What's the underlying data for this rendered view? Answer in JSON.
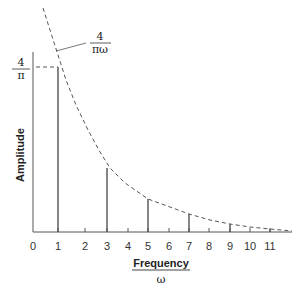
{
  "chart_data": {
    "type": "bar",
    "title": "",
    "xlabel": "Frequency / ω",
    "xlabel_numerator": "Frequency",
    "xlabel_denominator": "ω",
    "ylabel": "Amplitude",
    "x_ticks": [
      0,
      1,
      2,
      3,
      4,
      5,
      6,
      7,
      8,
      9,
      10,
      11
    ],
    "categories": [
      1,
      3,
      5,
      7,
      9,
      11
    ],
    "values": [
      1.273,
      0.424,
      0.255,
      0.182,
      0.141,
      0.116
    ],
    "value_formula": "4/(πω)",
    "envelope": {
      "label": "4/πω",
      "label_numerator": "4",
      "label_denominator": "πω",
      "style": "dashed"
    },
    "y_reference": {
      "label": "4/π",
      "label_numerator": "4",
      "label_denominator": "π",
      "value": 1.273,
      "style": "dashed"
    },
    "grid": false,
    "legend": null,
    "ylim": [
      0,
      1.4
    ],
    "xlim": [
      0,
      12
    ]
  },
  "layout": {
    "baseline_y": 232,
    "yaxis_x": 33,
    "yaxis_top": 52,
    "xaxis_end": 292,
    "tick_x": [
      33,
      58,
      85,
      107,
      128,
      148,
      169,
      189,
      209,
      230,
      250,
      270
    ],
    "bar_top_y": [
      67,
      168,
      199,
      214,
      224,
      229
    ],
    "curve_points": [
      [
        43,
        8
      ],
      [
        50,
        30
      ],
      [
        58,
        55
      ],
      [
        66,
        80
      ],
      [
        76,
        105
      ],
      [
        88,
        130
      ],
      [
        100,
        152
      ],
      [
        110,
        168
      ],
      [
        125,
        183
      ],
      [
        148,
        199
      ],
      [
        170,
        207
      ],
      [
        189,
        214
      ],
      [
        210,
        220
      ],
      [
        230,
        224
      ],
      [
        250,
        227
      ],
      [
        270,
        229
      ],
      [
        292,
        231
      ]
    ]
  },
  "colors": {
    "axis": "#555555",
    "bar": "#444444",
    "dash": "#555555",
    "text": "#333333"
  }
}
